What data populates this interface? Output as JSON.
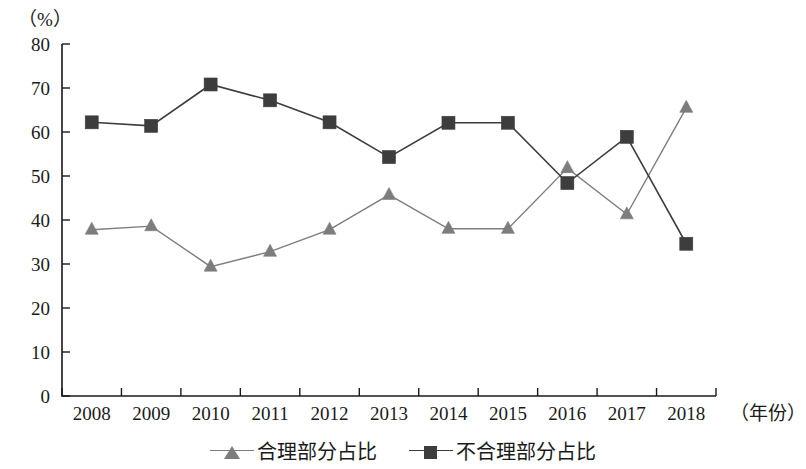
{
  "chart_data": {
    "type": "line",
    "title": "",
    "xlabel": "（年份）",
    "ylabel": "（%）",
    "categories": [
      "2008",
      "2009",
      "2010",
      "2011",
      "2012",
      "2013",
      "2014",
      "2015",
      "2016",
      "2017",
      "2018"
    ],
    "series": [
      {
        "name": "合理部分占比",
        "marker": "triangle",
        "color": "#7d7d7d",
        "values": [
          37.8,
          38.6,
          29.4,
          32.8,
          37.8,
          45.7,
          38.0,
          38.0,
          51.8,
          41.3,
          65.5
        ]
      },
      {
        "name": "不合理部分占比",
        "marker": "square",
        "color": "#3d3d3d",
        "values": [
          62.2,
          61.4,
          70.8,
          67.2,
          62.2,
          54.3,
          62.1,
          62.1,
          48.4,
          58.9,
          34.6
        ]
      }
    ],
    "ylim": [
      0,
      80
    ],
    "ytick_step": 10,
    "yticks": [
      "0",
      "10",
      "20",
      "30",
      "40",
      "50",
      "60",
      "70",
      "80"
    ],
    "grid": false,
    "legend_position": "bottom"
  },
  "axes": {
    "unit_label": "（%）",
    "x_axis_title": "（年份）"
  },
  "legend": {
    "items": [
      {
        "label": "合理部分占比",
        "marker": "triangle-marker",
        "color": "#7d7d7d"
      },
      {
        "label": "不合理部分占比",
        "marker": "square-marker",
        "color": "#3d3d3d"
      }
    ]
  }
}
